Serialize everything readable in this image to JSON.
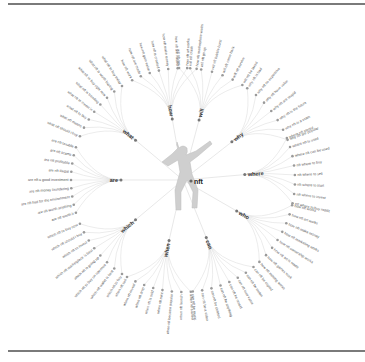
{
  "diagram": {
    "center": {
      "label": "nft",
      "icon": "figure-icon"
    },
    "colors": {
      "link": "#d9d9d9",
      "dot": "#9a9a9a",
      "text": "#555555",
      "rule": "#7a7a7a"
    },
    "branches": [
      {
        "label": "how",
        "angle": -100,
        "leaves": [
          "how nft work",
          "how nft are made",
          "how nft gain value",
          "how nft is created",
          "how nft make money",
          "how nft are valued",
          "how nft art works",
          "how nft marketplace works"
        ]
      },
      {
        "label": "will",
        "angle": -75,
        "leaves": [
          "will nft last",
          "will nft crash",
          "will nft go up",
          "will nft bubble burst",
          "will nft come back",
          "will nft survive",
          "will nft be taxed"
        ]
      },
      {
        "label": "why",
        "angle": -38,
        "leaves": [
          "why nft is bad",
          "why nft so expensive",
          "why nft have value",
          "why nft are stupid",
          "why nft is the future",
          "why nft is a scam",
          "why nft are popular"
        ]
      },
      {
        "label": "where",
        "angle": -5,
        "leaves": [
          "where nft stored",
          "where nft is used",
          "where nft can be used",
          "nft where to buy",
          "nft where to sell",
          "nft where to start",
          "nft where to invest",
          "nft where to buy reddit"
        ]
      },
      {
        "label": "who",
        "angle": 30,
        "leaves": [
          "how nft works",
          "how nft art works",
          "how nft make money",
          "how nft marketing works",
          "how nft ownership works",
          "how nft art is made",
          "how nft games work",
          "how nft minting works"
        ]
      },
      {
        "label": "can",
        "angle": 68,
        "leaves": [
          "can nft be copied",
          "can nft be stolen",
          "can nft lose value",
          "can nft be resold",
          "can nft be anything",
          "can nft be deleted",
          "can nft be a video",
          "can nft be music"
        ]
      },
      {
        "label": "when",
        "angle": 103,
        "leaves": [
          "when nft started",
          "when nft launch",
          "when nft became popular",
          "when nft mint",
          "when nft is sold",
          "when nft drop",
          "when nft reveal",
          "when nft sell"
        ]
      },
      {
        "label": "which",
        "angle": 140,
        "leaves": [
          "which nft to buy",
          "which nft wallet is best",
          "which nft to buy on opensea",
          "which nft is going up",
          "which nft marketplace is best",
          "which nft to invest",
          "which nft should i buy",
          "which nft to buy now"
        ]
      },
      {
        "label": "are",
        "angle": 180,
        "leaves": [
          "are nft worth it",
          "are nft worth anything",
          "are nft bad for the environment",
          "are nft money laundering",
          "are nft a good investment",
          "are nft illegal",
          "are nft profitable",
          "are nft scams",
          "are nft taxable"
        ]
      },
      {
        "label": "what",
        "angle": -140,
        "leaves": [
          "what nft should i buy",
          "what nft means",
          "what nft to buy",
          "what nft to invest in",
          "what nft is trending",
          "what nft to buy right now",
          "what nft is worth buying",
          "what nft to buy today"
        ]
      }
    ]
  }
}
